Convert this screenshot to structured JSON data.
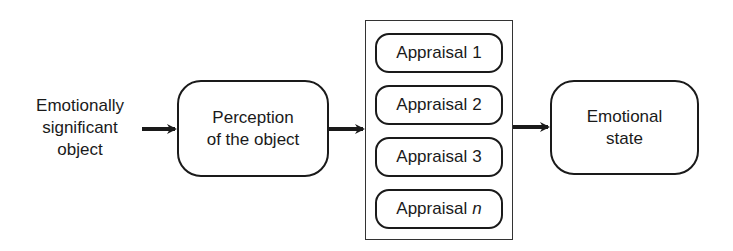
{
  "diagram": {
    "source_label": {
      "line1": "Emotionally",
      "line2": "significant",
      "line3": "object"
    },
    "perception_box": {
      "line1": "Perception",
      "line2": "of the object"
    },
    "appraisals": [
      {
        "prefix": "Appraisal",
        "index": "1"
      },
      {
        "prefix": "Appraisal",
        "index": "2"
      },
      {
        "prefix": "Appraisal",
        "index": "3"
      },
      {
        "prefix": "Appraisal",
        "index": "n"
      }
    ],
    "output_box": {
      "line1": "Emotional",
      "line2": "state"
    },
    "colors": {
      "stroke": "#1a1a1a",
      "background": "#ffffff"
    }
  }
}
